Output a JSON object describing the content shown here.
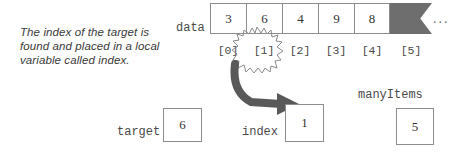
{
  "caption": {
    "text": "The index of the target is found and placed in a local variable called index."
  },
  "array": {
    "name_label": "data",
    "cells": [
      "3",
      "6",
      "4",
      "9",
      "8"
    ],
    "tail_cell": "",
    "ellipsis": "...",
    "index_labels": [
      "[0]",
      "[1]",
      "[2]",
      "[3]",
      "[4]",
      "[5]"
    ],
    "highlighted_index": "[1]"
  },
  "variables": [
    {
      "label": "target",
      "value": "6"
    },
    {
      "label": "index",
      "value": "1"
    },
    {
      "label": "manyItems",
      "value": "5"
    }
  ],
  "colors": {
    "tail_cell_fill": "#6e6e6e",
    "box_border": "#8c8c8c",
    "arrow_fill": "#595959",
    "text": "#333333"
  },
  "icons": {
    "starburst": "starburst-icon",
    "flow_arrow": "curved-arrow-icon"
  }
}
